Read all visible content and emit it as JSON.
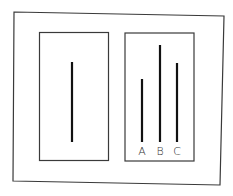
{
  "diagram": {
    "colors": {
      "stroke": "#3a3a3a",
      "line": "#111111",
      "background": "#ffffff"
    },
    "reference_card": {
      "line": {
        "length_px": 80
      }
    },
    "comparison_card": {
      "lines": [
        {
          "label": "A",
          "length_px": 63
        },
        {
          "label": "B",
          "length_px": 97
        },
        {
          "label": "C",
          "length_px": 79
        }
      ]
    }
  }
}
